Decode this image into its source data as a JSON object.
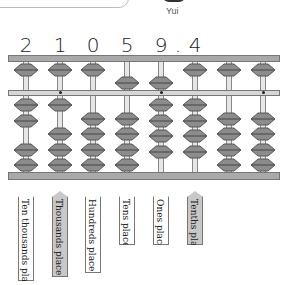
{
  "character": {
    "name": "Yui"
  },
  "number_display": {
    "digits": [
      "2",
      "1",
      "0",
      "5",
      "9",
      ".",
      "4"
    ]
  },
  "abacus": {
    "columns": [
      {
        "x": 26,
        "heaven_down": false,
        "earth_up": 2,
        "digit": "2",
        "dot": false
      },
      {
        "x": 60,
        "heaven_down": false,
        "earth_up": 1,
        "digit": "1",
        "dot": true
      },
      {
        "x": 93,
        "heaven_down": false,
        "earth_up": 0,
        "digit": "0",
        "dot": false
      },
      {
        "x": 127,
        "heaven_down": true,
        "earth_up": 0,
        "digit": "5",
        "dot": false
      },
      {
        "x": 161,
        "heaven_down": true,
        "earth_up": 4,
        "digit": "9",
        "dot": true
      },
      {
        "x": 195,
        "heaven_down": false,
        "earth_up": 4,
        "digit": "4",
        "dot": false
      },
      {
        "x": 229,
        "heaven_down": false,
        "earth_up": 0,
        "digit": "0",
        "dot": false
      },
      {
        "x": 263,
        "heaven_down": false,
        "earth_up": 0,
        "digit": "0",
        "dot": true
      }
    ],
    "colors": {
      "frame": "#a9a9a9",
      "bead": "#8c8c8c",
      "rod": "#e6e6e6"
    }
  },
  "place_labels": [
    {
      "text": "Ten thousands place",
      "shaded": false
    },
    {
      "text": "Thousands place",
      "shaded": true
    },
    {
      "text": "Hundreds place",
      "shaded": false
    },
    {
      "text": "Tens place",
      "shaded": false
    },
    {
      "text": "Ones place",
      "shaded": false
    },
    {
      "text": "Tenths place",
      "shaded": true
    }
  ]
}
